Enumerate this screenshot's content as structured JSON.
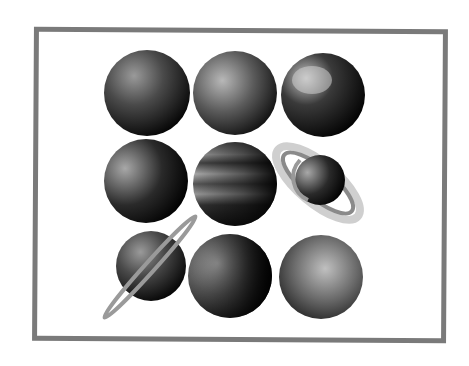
{
  "image": {
    "description": "Grayscale illustration of nine planets arranged in a 3x3 grid inside a gray rectangular frame",
    "frame_color": "#7a7a7a",
    "background": "#ffffff"
  },
  "planets": [
    {
      "name": "planet-1",
      "row": 1,
      "col": 1,
      "type": "rocky",
      "ringed": false
    },
    {
      "name": "planet-2",
      "row": 1,
      "col": 2,
      "type": "rocky",
      "ringed": false
    },
    {
      "name": "planet-3",
      "row": 1,
      "col": 3,
      "type": "earth-like",
      "ringed": false
    },
    {
      "name": "planet-4",
      "row": 2,
      "col": 1,
      "type": "rocky",
      "ringed": false
    },
    {
      "name": "planet-5",
      "row": 2,
      "col": 2,
      "type": "gas-giant-banded",
      "ringed": false
    },
    {
      "name": "planet-6",
      "row": 2,
      "col": 3,
      "type": "gas-giant",
      "ringed": true
    },
    {
      "name": "planet-7",
      "row": 3,
      "col": 1,
      "type": "rocky",
      "ringed": true
    },
    {
      "name": "planet-8",
      "row": 3,
      "col": 2,
      "type": "rocky",
      "ringed": false
    },
    {
      "name": "planet-9",
      "row": 3,
      "col": 3,
      "type": "dwarf",
      "ringed": false
    }
  ]
}
